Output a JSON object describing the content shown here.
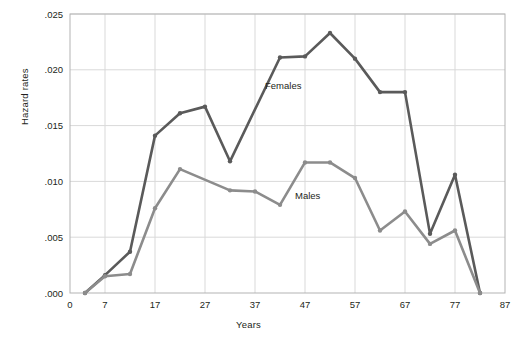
{
  "chart_data": {
    "type": "line",
    "title": "",
    "xlabel": "Years",
    "ylabel": "Hazard rates",
    "xlim": [
      0,
      87
    ],
    "ylim": [
      0.0,
      0.025
    ],
    "xticks": [
      0,
      7,
      17,
      27,
      37,
      47,
      57,
      67,
      77,
      87
    ],
    "xticklabels": [
      "0",
      "7",
      "17",
      "27",
      "37",
      "47",
      "57",
      "67",
      "77",
      "87"
    ],
    "yticks": [
      0.0,
      0.005,
      0.01,
      0.015,
      0.02,
      0.025
    ],
    "yticklabels": [
      ".000",
      ".005",
      ".010",
      ".015",
      ".020",
      ".025"
    ],
    "grid": "both",
    "gridlines_x": [
      7,
      17,
      27,
      37,
      47,
      57,
      67,
      77
    ],
    "gridlines_y": [
      0.005,
      0.01,
      0.015,
      0.02,
      0.025
    ],
    "legend_position": "inline-annotation",
    "series": [
      {
        "name": "Females",
        "color": "#5a5a5a",
        "label_x": 39,
        "label_y": 0.0183,
        "points": [
          {
            "x": 3,
            "y": 0.0
          },
          {
            "x": 7,
            "y": 0.0016
          },
          {
            "x": 12,
            "y": 0.0037
          },
          {
            "x": 17,
            "y": 0.0141
          },
          {
            "x": 22,
            "y": 0.0161
          },
          {
            "x": 27,
            "y": 0.0167
          },
          {
            "x": 32,
            "y": 0.0118
          },
          {
            "x": 42,
            "y": 0.0211
          },
          {
            "x": 47,
            "y": 0.0212
          },
          {
            "x": 52,
            "y": 0.0233
          },
          {
            "x": 57,
            "y": 0.021
          },
          {
            "x": 62,
            "y": 0.018
          },
          {
            "x": 67,
            "y": 0.018
          },
          {
            "x": 72,
            "y": 0.0053
          },
          {
            "x": 77,
            "y": 0.0106
          },
          {
            "x": 82,
            "y": 0.0
          }
        ]
      },
      {
        "name": "Males",
        "color": "#8c8c8c",
        "label_x": 45,
        "label_y": 0.0084,
        "points": [
          {
            "x": 3,
            "y": 0.0
          },
          {
            "x": 7,
            "y": 0.0015
          },
          {
            "x": 12,
            "y": 0.0017
          },
          {
            "x": 17,
            "y": 0.0076
          },
          {
            "x": 22,
            "y": 0.0111
          },
          {
            "x": 32,
            "y": 0.0092
          },
          {
            "x": 37,
            "y": 0.0091
          },
          {
            "x": 42,
            "y": 0.0079
          },
          {
            "x": 47,
            "y": 0.0117
          },
          {
            "x": 52,
            "y": 0.0117
          },
          {
            "x": 57,
            "y": 0.0103
          },
          {
            "x": 62,
            "y": 0.0056
          },
          {
            "x": 67,
            "y": 0.0073
          },
          {
            "x": 72,
            "y": 0.0044
          },
          {
            "x": 77,
            "y": 0.0056
          },
          {
            "x": 82,
            "y": 0.0
          }
        ]
      }
    ]
  },
  "axes": {
    "frame_color": "#b3b3b3",
    "grid_color": "#d9d9d9",
    "text_color": "#231f20"
  }
}
